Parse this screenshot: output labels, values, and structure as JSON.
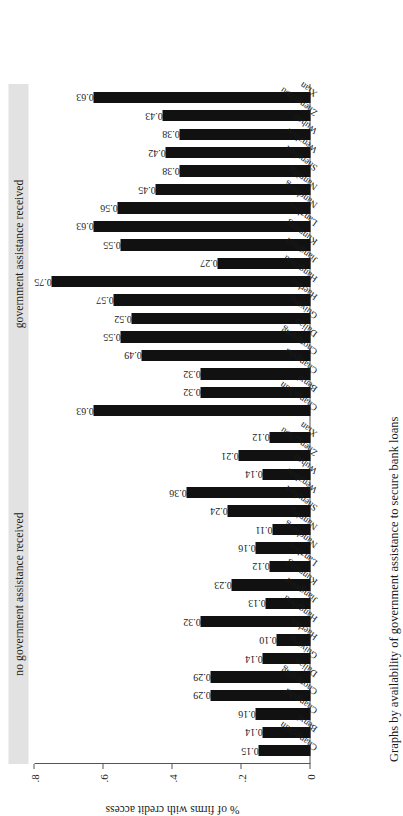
{
  "figure": {
    "caption": "Graphs by availability of government assistance to secure bank loans",
    "yaxis_title": "% of firms with credit access",
    "ytick_labels": [
      "0",
      ".2",
      ".4",
      ".6",
      ".8"
    ]
  },
  "panels": [
    {
      "title": "no government assistance received"
    },
    {
      "title": "government assistance received"
    }
  ],
  "chart_data": {
    "type": "bar",
    "title": "",
    "subtitle": "",
    "xlabel": "",
    "ylabel": "% of firms with credit access",
    "ylim": [
      0,
      0.8
    ],
    "ytick_values": [
      0,
      0.2,
      0.4,
      0.6,
      0.8
    ],
    "ytick_labels": [
      "0",
      ".2",
      ".4",
      ".6",
      ".8"
    ],
    "grid": false,
    "legend": "none",
    "bar_color": "#111111",
    "panel_strip_color": "#e2e2e2",
    "note": "Small-multiple (faceted) bar chart, two panels, shared y-axis. Values shown as data labels above each bar.",
    "categories": [
      "Changchun",
      "Benxi",
      "Changsha",
      "Chongqing",
      "Dalian",
      "Guiyang",
      "Haerbin",
      "Hangzhou",
      "Jiangmen",
      "Kunming",
      "Lanzhou",
      "Nanchang",
      "Nanning",
      "Shenzhen",
      "Wenzhou",
      "Wuhan",
      "Zhengzhou",
      "Xian"
    ],
    "panels": [
      {
        "name": "no government assistance received",
        "values": [
          0.15,
          0.14,
          0.16,
          0.29,
          0.29,
          0.14,
          0.1,
          0.32,
          0.13,
          0.23,
          0.12,
          0.16,
          0.11,
          0.24,
          0.36,
          0.14,
          0.21,
          0.12
        ],
        "labels": [
          "0.15",
          "0.14",
          "0.16",
          "0.29",
          "0.29",
          "0.14",
          "0.10",
          "0.32",
          "0.13",
          "0.23",
          "0.12",
          "0.16",
          "0.11",
          "0.24",
          "0.36",
          "0.14",
          "0.21",
          "0.12"
        ]
      },
      {
        "name": "government assistance received",
        "values": [
          0.63,
          0.32,
          0.32,
          0.49,
          0.55,
          0.52,
          0.57,
          0.75,
          0.27,
          0.55,
          0.63,
          0.56,
          0.45,
          0.38,
          0.42,
          0.38,
          0.43,
          0.63
        ],
        "labels": [
          "0.63",
          "0.32",
          "0.32",
          "0.49",
          "0.55",
          "0.52",
          "0.57",
          "0.75",
          "0.27",
          "0.55",
          "0.63",
          "0.56",
          "0.45",
          "0.38",
          "0.42",
          "0.38",
          "0.43",
          "0.63"
        ]
      }
    ]
  }
}
